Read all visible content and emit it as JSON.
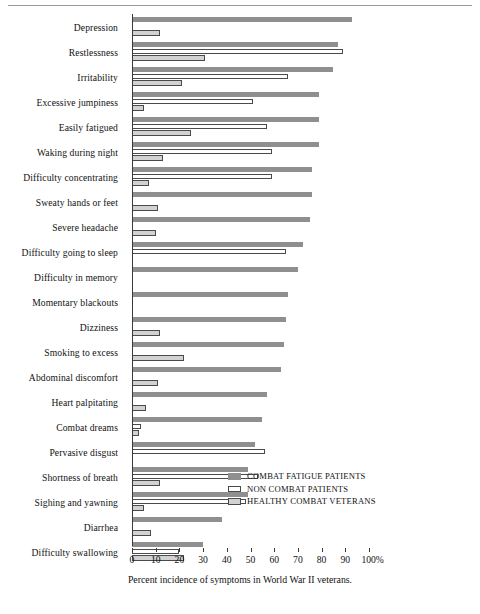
{
  "caption": "Percent incidence of symptoms in World War II veterans.",
  "legend": {
    "position": "inside-right",
    "items": [
      {
        "key": "combat_fatigue",
        "label": "COMBAT FATIGUE PATIENTS",
        "color": "#8f8f8f"
      },
      {
        "key": "non_combat",
        "label": "NON COMBAT PATIENTS",
        "color": "#ffffff"
      },
      {
        "key": "healthy_veterans",
        "label": "HEALTHY COMBAT VETERANS",
        "color": "#d2d2d2"
      }
    ]
  },
  "axis": {
    "ticks": [
      0,
      10,
      20,
      30,
      40,
      50,
      60,
      70,
      80,
      90,
      100
    ],
    "tick_labels": [
      "0",
      "10",
      "20",
      "30",
      "40",
      "50",
      "60",
      "70",
      "80",
      "90",
      "100%"
    ],
    "min": 0,
    "max": 100
  },
  "chart_data": {
    "type": "bar",
    "orientation": "horizontal",
    "title": "",
    "subtitle": "",
    "xlabel": "Percent incidence of symptoms in World War II veterans.",
    "ylabel": "",
    "xlim": [
      0,
      100
    ],
    "grid": false,
    "legend_position": "inside-right",
    "categories": [
      "Depression",
      "Restlessness",
      "Irritability",
      "Excessive jumpiness",
      "Easily fatigued",
      "Waking during night",
      "Difficulty concentrating",
      "Sweaty hands or feet",
      "Severe headache",
      "Difficulty going to sleep",
      "Difficulty in memory",
      "Momentary blackouts",
      "Dizziness",
      "Smoking to excess",
      "Abdominal discomfort",
      "Heart palpitating",
      "Combat dreams",
      "Pervasive disgust",
      "Shortness of breath",
      "Sighing and yawning",
      "Diarrhea",
      "Difficulty swallowing"
    ],
    "series": [
      {
        "name": "COMBAT FATIGUE PATIENTS",
        "color": "#8f8f8f",
        "values": [
          93,
          87,
          85,
          79,
          79,
          79,
          76,
          76,
          75,
          72,
          70,
          66,
          65,
          64,
          63,
          57,
          55,
          52,
          49,
          49,
          38,
          30
        ]
      },
      {
        "name": "NON COMBAT PATIENTS",
        "color": "#ffffff",
        "values": [
          0,
          89,
          66,
          51,
          57,
          59,
          59,
          0,
          0,
          65,
          0,
          0,
          0,
          0,
          0,
          0,
          4,
          56,
          53,
          48,
          0,
          20
        ]
      },
      {
        "name": "HEALTHY COMBAT VETERANS",
        "color": "#d2d2d2",
        "values": [
          12,
          31,
          21,
          5,
          25,
          13,
          7,
          11,
          10,
          0,
          0,
          0,
          12,
          22,
          11,
          6,
          3,
          0,
          12,
          5,
          8,
          22
        ]
      }
    ]
  }
}
